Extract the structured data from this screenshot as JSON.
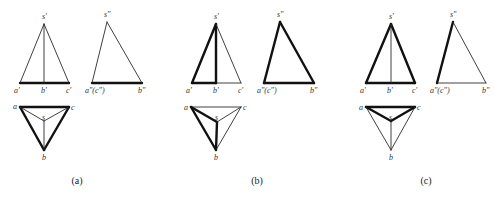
{
  "figure": {
    "panels": [
      {
        "id": "a",
        "caption": "(a)",
        "caption_pos": [
          77,
          184
        ],
        "lines": [
          {
            "view": "front",
            "from": [
              20,
              83
            ],
            "to": [
              69,
              83
            ],
            "weight": "thick"
          },
          {
            "view": "front",
            "from": [
              20,
              83
            ],
            "to": [
              44,
              24
            ],
            "weight": "thin"
          },
          {
            "view": "front",
            "from": [
              44,
              24
            ],
            "to": [
              69,
              83
            ],
            "weight": "thin"
          },
          {
            "view": "front",
            "from": [
              44,
              24
            ],
            "to": [
              44,
              83
            ],
            "weight": "thin"
          },
          {
            "view": "side",
            "from": [
              92,
              83
            ],
            "to": [
              142,
              83
            ],
            "weight": "thick"
          },
          {
            "view": "side",
            "from": [
              92,
              83
            ],
            "to": [
              107,
              22
            ],
            "weight": "thin"
          },
          {
            "view": "side",
            "from": [
              107,
              22
            ],
            "to": [
              142,
              83
            ],
            "weight": "thin"
          },
          {
            "view": "top",
            "from": [
              20,
              107
            ],
            "to": [
              69,
              107
            ],
            "weight": "thick"
          },
          {
            "view": "top",
            "from": [
              20,
              107
            ],
            "to": [
              44,
              150
            ],
            "weight": "thick"
          },
          {
            "view": "top",
            "from": [
              69,
              107
            ],
            "to": [
              44,
              150
            ],
            "weight": "thick"
          },
          {
            "view": "top",
            "from": [
              20,
              107
            ],
            "to": [
              44,
              121
            ],
            "weight": "thin"
          },
          {
            "view": "top",
            "from": [
              69,
              107
            ],
            "to": [
              44,
              121
            ],
            "weight": "thin"
          },
          {
            "view": "top",
            "from": [
              44,
              121
            ],
            "to": [
              44,
              150
            ],
            "weight": "thin"
          }
        ],
        "labels": [
          {
            "text": "s'",
            "pos": [
              42,
              19
            ]
          },
          {
            "text": "a'",
            "pos": [
              14,
              93
            ]
          },
          {
            "text": "b'",
            "pos": [
              41,
              93
            ]
          },
          {
            "text": "c'",
            "pos": [
              66,
              93
            ]
          },
          {
            "text": "s\"",
            "pos": [
              104,
              17
            ]
          },
          {
            "text": "a\"(c\")",
            "pos": [
              85,
              93
            ]
          },
          {
            "text": "b\"",
            "pos": [
              138,
              93
            ]
          },
          {
            "text": "a",
            "pos": [
              13,
              109
            ]
          },
          {
            "text": "c",
            "pos": [
              71,
              110
            ]
          },
          {
            "text": "s",
            "pos": [
              42,
              120
            ]
          },
          {
            "text": "b",
            "pos": [
              42,
              160
            ]
          }
        ]
      },
      {
        "id": "b",
        "caption": "(b)",
        "caption_pos": [
          257,
          184
        ],
        "lines": [
          {
            "view": "front",
            "from": [
              192,
              83
            ],
            "to": [
              216,
              83
            ],
            "weight": "thick"
          },
          {
            "view": "front",
            "from": [
              216,
              83
            ],
            "to": [
              241,
              83
            ],
            "weight": "thin"
          },
          {
            "view": "front",
            "from": [
              192,
              83
            ],
            "to": [
              216,
              24
            ],
            "weight": "thick"
          },
          {
            "view": "front",
            "from": [
              216,
              24
            ],
            "to": [
              216,
              83
            ],
            "weight": "thick"
          },
          {
            "view": "front",
            "from": [
              216,
              24
            ],
            "to": [
              241,
              83
            ],
            "weight": "thin"
          },
          {
            "view": "side",
            "from": [
              264,
              83
            ],
            "to": [
              314,
              83
            ],
            "weight": "thick"
          },
          {
            "view": "side",
            "from": [
              264,
              83
            ],
            "to": [
              280,
              22
            ],
            "weight": "thick"
          },
          {
            "view": "side",
            "from": [
              280,
              22
            ],
            "to": [
              314,
              83
            ],
            "weight": "thick"
          },
          {
            "view": "top",
            "from": [
              191,
              107
            ],
            "to": [
              241,
              107
            ],
            "weight": "thin"
          },
          {
            "view": "top",
            "from": [
              191,
              107
            ],
            "to": [
              216,
              150
            ],
            "weight": "thick"
          },
          {
            "view": "top",
            "from": [
              191,
              107
            ],
            "to": [
              217,
              122
            ],
            "weight": "thick"
          },
          {
            "view": "top",
            "from": [
              217,
              122
            ],
            "to": [
              216,
              150
            ],
            "weight": "thick"
          },
          {
            "view": "top",
            "from": [
              241,
              107
            ],
            "to": [
              217,
              122
            ],
            "weight": "thin"
          },
          {
            "view": "top",
            "from": [
              241,
              107
            ],
            "to": [
              216,
              150
            ],
            "weight": "thin"
          }
        ],
        "labels": [
          {
            "text": "s'",
            "pos": [
              214,
              19
            ]
          },
          {
            "text": "a'",
            "pos": [
              186,
              93
            ]
          },
          {
            "text": "b'",
            "pos": [
              213,
              93
            ]
          },
          {
            "text": "c'",
            "pos": [
              238,
              93
            ]
          },
          {
            "text": "s\"",
            "pos": [
              277,
              17
            ]
          },
          {
            "text": "a\"(c\")",
            "pos": [
              257,
              93
            ]
          },
          {
            "text": "b\"",
            "pos": [
              310,
              93
            ]
          },
          {
            "text": "a",
            "pos": [
              184,
              110
            ]
          },
          {
            "text": "c",
            "pos": [
              243,
              110
            ]
          },
          {
            "text": "s",
            "pos": [
              215,
              120
            ]
          },
          {
            "text": "b",
            "pos": [
              214,
              160
            ]
          }
        ]
      },
      {
        "id": "c",
        "caption": "(c)",
        "caption_pos": [
          426,
          184
        ],
        "lines": [
          {
            "view": "front",
            "from": [
              366,
              83
            ],
            "to": [
              415,
              83
            ],
            "weight": "thick"
          },
          {
            "view": "front",
            "from": [
              366,
              83
            ],
            "to": [
              391,
              24
            ],
            "weight": "thick"
          },
          {
            "view": "front",
            "from": [
              391,
              24
            ],
            "to": [
              415,
              83
            ],
            "weight": "thick"
          },
          {
            "view": "front",
            "from": [
              391,
              24
            ],
            "to": [
              391,
              83
            ],
            "weight": "thin"
          },
          {
            "view": "side",
            "from": [
              437,
              83
            ],
            "to": [
              486,
              83
            ],
            "weight": "thin"
          },
          {
            "view": "side",
            "from": [
              437,
              83
            ],
            "to": [
              453,
              22
            ],
            "weight": "thick"
          },
          {
            "view": "side",
            "from": [
              453,
              22
            ],
            "to": [
              486,
              83
            ],
            "weight": "thin"
          },
          {
            "view": "top",
            "from": [
              366,
              107
            ],
            "to": [
              415,
              107
            ],
            "weight": "thick"
          },
          {
            "view": "top",
            "from": [
              366,
              107
            ],
            "to": [
              391,
              121
            ],
            "weight": "thick"
          },
          {
            "view": "top",
            "from": [
              415,
              107
            ],
            "to": [
              391,
              121
            ],
            "weight": "thick"
          },
          {
            "view": "top",
            "from": [
              366,
              107
            ],
            "to": [
              391,
              150
            ],
            "weight": "thin"
          },
          {
            "view": "top",
            "from": [
              415,
              107
            ],
            "to": [
              391,
              150
            ],
            "weight": "thin"
          },
          {
            "view": "top",
            "from": [
              391,
              121
            ],
            "to": [
              391,
              150
            ],
            "weight": "thin"
          }
        ],
        "labels": [
          {
            "text": "s'",
            "pos": [
              389,
              19
            ]
          },
          {
            "text": "a'",
            "pos": [
              360,
              93
            ]
          },
          {
            "text": "b'",
            "pos": [
              387,
              93
            ]
          },
          {
            "text": "c'",
            "pos": [
              412,
              93
            ]
          },
          {
            "text": "s\"",
            "pos": [
              450,
              17
            ]
          },
          {
            "text": "a\"(c\")",
            "pos": [
              430,
              93
            ]
          },
          {
            "text": "b\"",
            "pos": [
              482,
              93
            ]
          },
          {
            "text": "a",
            "pos": [
              359,
              110
            ]
          },
          {
            "text": "c",
            "pos": [
              417,
              110
            ]
          },
          {
            "text": "s",
            "pos": [
              389,
              120
            ]
          },
          {
            "text": "b",
            "pos": [
              389,
              160
            ]
          }
        ]
      }
    ]
  }
}
